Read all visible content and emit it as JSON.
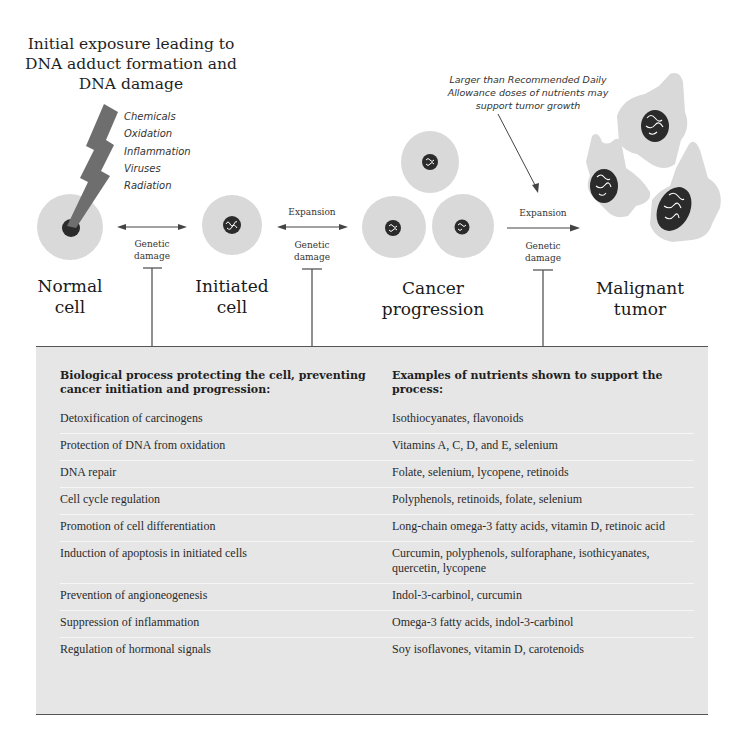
{
  "diagram": {
    "title": "Initial exposure leading to DNA adduct formation and DNA damage",
    "title_lines": [
      "Initial exposure leading to",
      "DNA adduct formation and",
      "DNA damage"
    ],
    "exposure_agents": [
      "Chemicals",
      "Oxidation",
      "Inflammation",
      "Viruses",
      "Radiation"
    ],
    "rda_note_lines": [
      "Larger than Recommended Daily",
      "Allowance doses of nutrients may",
      "support tumor growth"
    ],
    "stages": [
      {
        "label_lines": [
          "Normal",
          "cell"
        ]
      },
      {
        "label_lines": [
          "Initiated",
          "cell"
        ]
      },
      {
        "label_lines": [
          "Cancer",
          "progression"
        ]
      },
      {
        "label_lines": [
          "Malignant",
          "tumor"
        ]
      }
    ],
    "transitions": [
      {
        "top_label": "",
        "bottom_lines": [
          "Genetic",
          "damage"
        ],
        "bidirectional": true
      },
      {
        "top_label": "Expansion",
        "bottom_lines": [
          "Genetic",
          "damage"
        ],
        "bidirectional": true
      },
      {
        "top_label": "Expansion",
        "bottom_lines": [
          "Genetic",
          "damage"
        ],
        "bidirectional": false
      }
    ],
    "colors": {
      "cell_fill": "#d9d9d9",
      "nucleus": "#2b2b2b",
      "bolt": "#6e6e6e",
      "panel_bg": "#e6e6e6",
      "line": "#555555"
    }
  },
  "table": {
    "headers": [
      "Biological process protecting the cell, preventing cancer initiation and progression:",
      "Examples of nutrients shown to support the process:"
    ],
    "rows": [
      {
        "process": "Detoxification of carcinogens",
        "nutrients": "Isothiocyanates, flavonoids"
      },
      {
        "process": "Protection of DNA from oxidation",
        "nutrients": "Vitamins A, C, D, and E, selenium"
      },
      {
        "process": "DNA repair",
        "nutrients": "Folate, selenium, lycopene, retinoids"
      },
      {
        "process": "Cell cycle regulation",
        "nutrients": "Polyphenols, retinoids, folate, selenium"
      },
      {
        "process": "Promotion of cell differentiation",
        "nutrients": "Long-chain omega-3 fatty acids, vitamin D, retinoic acid"
      },
      {
        "process": "Induction of apoptosis in initiated cells",
        "nutrients": "Curcumin, polyphenols, sulforaphane, isothicyanates, quercetin, lycopene"
      },
      {
        "process": "Prevention of angioneogenesis",
        "nutrients": "Indol-3-carbinol, curcumin"
      },
      {
        "process": "Suppression of inflammation",
        "nutrients": "Omega-3 fatty acids, indol-3-carbinol"
      },
      {
        "process": "Regulation of hormonal signals",
        "nutrients": "Soy isoflavones, vitamin D, carotenoids"
      }
    ]
  }
}
